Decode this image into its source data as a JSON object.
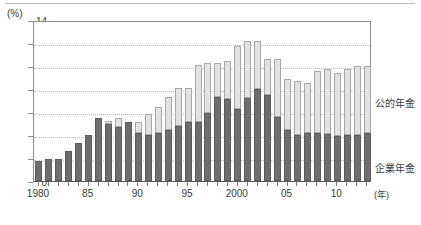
{
  "chart_data": {
    "type": "bar",
    "stacked": true,
    "title": "",
    "subtitle": "",
    "xlabel": "(年)",
    "ylabel": "(%)",
    "ylim": [
      0,
      14
    ],
    "ytick_values": [
      0,
      2,
      4,
      6,
      8,
      10,
      12,
      14
    ],
    "ytick_labels": [
      "0",
      "2",
      "4",
      "6",
      "8",
      "10",
      "12",
      "14"
    ],
    "grid": "horizontal-dotted",
    "legend_position": "right-inline",
    "x": [
      1980,
      1981,
      1982,
      1983,
      1984,
      1985,
      1986,
      1987,
      1988,
      1989,
      1990,
      1991,
      1992,
      1993,
      1994,
      1995,
      1996,
      1997,
      1998,
      1999,
      2000,
      2001,
      2002,
      2003,
      2004,
      2005,
      2006,
      2007,
      2008,
      2009,
      2010,
      2011,
      2012,
      2013
    ],
    "categories": [
      "1980",
      "1981",
      "1982",
      "1983",
      "1984",
      "1985",
      "1986",
      "1987",
      "1988",
      "1989",
      "1990",
      "1991",
      "1992",
      "1993",
      "1994",
      "1995",
      "1996",
      "1997",
      "1998",
      "1999",
      "2000",
      "2001",
      "2002",
      "2003",
      "2004",
      "2005",
      "2006",
      "2007",
      "2008",
      "2009",
      "2010",
      "2011",
      "2012",
      "2013"
    ],
    "xtick_labels": [
      "1980",
      "85",
      "90",
      "95",
      "2000",
      "05",
      "10"
    ],
    "xtick_values": [
      1980,
      1985,
      1990,
      1995,
      2000,
      2005,
      2010
    ],
    "series": [
      {
        "name": "企業年金",
        "color": "#6e6e6e",
        "values": [
          1.7,
          1.9,
          1.9,
          2.6,
          3.3,
          4.0,
          5.5,
          5.0,
          4.7,
          5.1,
          4.2,
          4.0,
          4.2,
          4.4,
          4.8,
          5.1,
          5.1,
          5.9,
          7.3,
          7.1,
          6.3,
          7.2,
          8.0,
          7.5,
          5.6,
          4.4,
          4.0,
          4.2,
          4.2,
          4.1,
          3.9,
          4.0,
          4.0,
          4.2
        ]
      },
      {
        "name": "公的年金",
        "color": "#e2e2e0",
        "values": [
          0.0,
          0.0,
          0.0,
          0.0,
          0.0,
          0.0,
          0.0,
          0.2,
          0.8,
          0.0,
          0.9,
          1.8,
          2.2,
          2.9,
          3.3,
          3.0,
          5.0,
          4.4,
          3.0,
          3.3,
          5.4,
          5.0,
          4.2,
          3.1,
          5.0,
          4.5,
          4.7,
          4.3,
          5.4,
          5.6,
          5.5,
          5.7,
          6.0,
          5.8
        ]
      }
    ],
    "totals": [
      1.7,
      1.9,
      1.9,
      2.6,
      3.3,
      4.0,
      5.5,
      5.2,
      5.5,
      5.1,
      5.1,
      5.8,
      6.4,
      7.3,
      8.1,
      8.1,
      10.1,
      10.3,
      10.3,
      10.4,
      11.7,
      12.2,
      12.2,
      10.6,
      10.6,
      8.9,
      8.7,
      8.5,
      9.6,
      9.7,
      9.4,
      9.7,
      10.0,
      10.0
    ]
  },
  "axes": {
    "unit_label": "(%)",
    "year_unit": "(年)"
  },
  "labels": {
    "public_pension": "公的年金",
    "corporate_pension": "企業年金"
  }
}
